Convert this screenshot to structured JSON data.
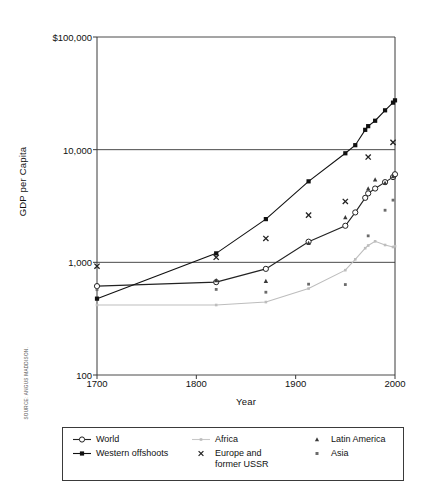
{
  "chart_data": {
    "type": "line",
    "title": "",
    "xlabel": "Year",
    "ylabel": "GDP per Capita",
    "xlim": [
      1700,
      2000
    ],
    "ylim": [
      100,
      100000
    ],
    "yscale": "log",
    "grid": true,
    "legend_position": "below",
    "xticks": [
      1700,
      1800,
      1900,
      2000
    ],
    "xticklabels": [
      "1700",
      "1800",
      "1900",
      "2000"
    ],
    "yticks": [
      100,
      1000,
      10000,
      100000
    ],
    "yticklabels": [
      "100",
      "1,000",
      "10,000",
      "$100,000"
    ],
    "series": [
      {
        "name": "World",
        "marker": "open-circle",
        "line": true,
        "color": "#222222",
        "x": [
          1700,
          1820,
          1870,
          1913,
          1950,
          1960,
          1970,
          1973,
          1980,
          1990,
          1998,
          2000
        ],
        "values": [
          615,
          667,
          875,
          1525,
          2111,
          2773,
          3736,
          4091,
          4520,
          5150,
          5709,
          6050
        ]
      },
      {
        "name": "Western offshoots",
        "marker": "filled-square",
        "line": true,
        "color": "#111111",
        "x": [
          1700,
          1820,
          1870,
          1913,
          1950,
          1960,
          1970,
          1973,
          1980,
          1990,
          1998,
          2000
        ],
        "values": [
          476,
          1201,
          2419,
          5233,
          9288,
          10961,
          15000,
          16172,
          18060,
          22346,
          26146,
          27400
        ]
      },
      {
        "name": "Africa",
        "marker": "small-dot",
        "line": true,
        "color": "#bdbdbd",
        "x": [
          1700,
          1820,
          1870,
          1913,
          1950,
          1960,
          1970,
          1973,
          1980,
          1990,
          1998,
          2000
        ],
        "values": [
          418,
          418,
          444,
          585,
          852,
          1063,
          1335,
          1410,
          1536,
          1425,
          1368,
          1390
        ]
      },
      {
        "name": "Europe and former USSR",
        "marker": "cross-x",
        "line": false,
        "color": "#222222",
        "x": [
          1700,
          1820,
          1870,
          1913,
          1950,
          1973,
          1998
        ],
        "values": [
          924,
          1109,
          1629,
          2622,
          3470,
          8600,
          11600
        ]
      },
      {
        "name": "Latin America",
        "marker": "triangle",
        "line": false,
        "color": "#3a3a3a",
        "x": [
          1820,
          1870,
          1913,
          1950,
          1973,
          1980,
          1990,
          1998
        ],
        "values": [
          692,
          681,
          1481,
          2506,
          4504,
          5412,
          5055,
          5795
        ]
      },
      {
        "name": "Asia",
        "marker": "small-square",
        "line": false,
        "color": "#6b6b6b",
        "x": [
          1700,
          1820,
          1870,
          1913,
          1950,
          1973,
          1990,
          1998
        ],
        "values": [
          572,
          575,
          543,
          640,
          635,
          1718,
          2900,
          3565
        ]
      }
    ]
  },
  "axes": {
    "ylabel": "GDP per Capita",
    "xlabel": "Year",
    "ytick_labels": [
      "$100,000",
      "10,000",
      "1,000",
      "100"
    ],
    "xtick_labels": [
      "1700",
      "1800",
      "1900",
      "2000"
    ]
  },
  "legend": {
    "columns": [
      {
        "items": [
          {
            "label": "World",
            "marker": "open-circle-line"
          },
          {
            "label": "Western offshoots",
            "marker": "filled-square-line"
          }
        ]
      },
      {
        "items": [
          {
            "label": "Africa",
            "marker": "gray-dot-line"
          },
          {
            "label": "Europe and",
            "label2": "former USSR",
            "marker": "cross-x"
          }
        ]
      },
      {
        "items": [
          {
            "label": "Latin America",
            "marker": "triangle"
          },
          {
            "label": "Asia",
            "marker": "small-square"
          }
        ]
      }
    ]
  },
  "source": {
    "text": "SOURCE: ANGUS MADDISON."
  },
  "colors": {
    "axis": "#3a3a3a",
    "grid": "#4a4a4a",
    "world": "#222222",
    "western_offshoots": "#111111",
    "africa": "#bdbdbd",
    "europe": "#222222",
    "latin_america": "#3a3a3a",
    "asia": "#6b6b6b"
  }
}
